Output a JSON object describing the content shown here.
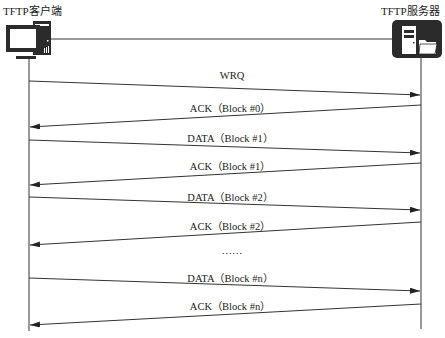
{
  "client": {
    "title": "TFTP客户端",
    "icon": "desktop-computer-icon"
  },
  "server": {
    "title": "TFTP服务器",
    "icon": "server-folder-icon"
  },
  "messages": [
    {
      "label": "WRQ",
      "direction": "client-to-server"
    },
    {
      "label": "ACK（Block #0）",
      "direction": "server-to-client"
    },
    {
      "label": "DATA（Block #1）",
      "direction": "client-to-server"
    },
    {
      "label": "ACK（Block #1）",
      "direction": "server-to-client"
    },
    {
      "label": "DATA（Block #2）",
      "direction": "client-to-server"
    },
    {
      "label": "ACK（Block #2）",
      "direction": "server-to-client"
    },
    {
      "label": "……",
      "direction": "none"
    },
    {
      "label": "DATA（Block #n）",
      "direction": "client-to-server"
    },
    {
      "label": "ACK（Block #n）",
      "direction": "server-to-client"
    }
  ],
  "colors": {
    "line": "#333333",
    "server_box": "#2b2b2b"
  }
}
